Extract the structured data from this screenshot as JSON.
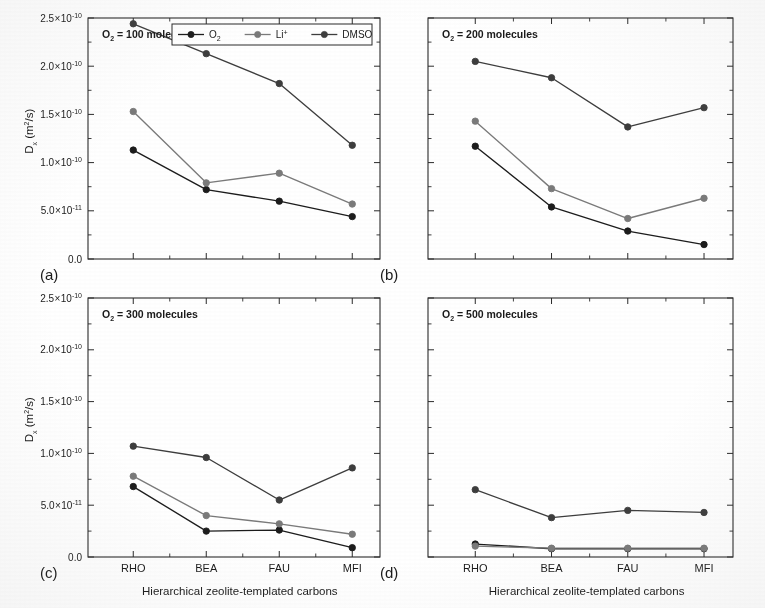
{
  "figure": {
    "caption_tags": [
      "(a)",
      "(b)",
      "(c)",
      "(d)"
    ],
    "x_axis_title": "Hierarchical zeolite-templated carbons",
    "y_axis_title_main": "D",
    "y_axis_title_sub": "x",
    "y_axis_title_unit": " (m",
    "y_axis_title_unit_sup": "2",
    "y_axis_title_unit_tail": "/s)"
  },
  "legend": {
    "position": "top-right of panel (a)",
    "entries": [
      {
        "label": "O",
        "sub": "2",
        "sup": "",
        "color": "#1c1c1c",
        "marker": "filled-circle"
      },
      {
        "label": "Li",
        "sub": "",
        "sup": "+",
        "color": "#7a7a7a",
        "marker": "filled-circle"
      },
      {
        "label": "DMSO",
        "sub": "",
        "sup": "",
        "color": "#3d3d3d",
        "marker": "filled-circle"
      }
    ]
  },
  "axis": {
    "y_ticks": [
      {
        "value": 0.0,
        "label_mantissa": "0.0",
        "label_base": "",
        "label_exp": ""
      },
      {
        "value": 5e-11,
        "label_mantissa": "5.0",
        "label_base": "10",
        "label_exp": "-11"
      },
      {
        "value": 1e-10,
        "label_mantissa": "1.0",
        "label_base": "10",
        "label_exp": "-10"
      },
      {
        "value": 1.5e-10,
        "label_mantissa": "1.5",
        "label_base": "10",
        "label_exp": "-10"
      },
      {
        "value": 2e-10,
        "label_mantissa": "2.0",
        "label_base": "10",
        "label_exp": "-10"
      },
      {
        "value": 2.5e-10,
        "label_mantissa": "2.5",
        "label_base": "10",
        "label_exp": "-10"
      }
    ],
    "y_min": 0.0,
    "y_max": 2.5e-10,
    "x_categories": [
      "RHO",
      "BEA",
      "FAU",
      "MFI"
    ],
    "grid": "none",
    "multiply_glyph": "×"
  },
  "chart_data": [
    {
      "panel": "a",
      "tag": "(a)",
      "type": "line",
      "title": "",
      "annotation_prefix": "O",
      "annotation_sub": "2",
      "annotation_suffix": " = 100 molecules",
      "annotation": "O2 = 100 molecules",
      "xlabel": "Hierarchical zeolite-templated carbons",
      "ylabel": "Dx (m2/s)",
      "ylim": [
        0,
        2.5e-10
      ],
      "categories": [
        "RHO",
        "BEA",
        "FAU",
        "MFI"
      ],
      "show_y_ticklabels": true,
      "show_x_ticklabels": false,
      "show_legend": true,
      "series": [
        {
          "name": "O2",
          "color": "#1c1c1c",
          "values": [
            1.13e-10,
            7.2e-11,
            6e-11,
            4.4e-11
          ]
        },
        {
          "name": "Li+",
          "color": "#7a7a7a",
          "values": [
            1.53e-10,
            7.9e-11,
            8.9e-11,
            5.7e-11
          ]
        },
        {
          "name": "DMSO",
          "color": "#3d3d3d",
          "values": [
            2.44e-10,
            2.13e-10,
            1.82e-10,
            1.18e-10
          ]
        }
      ]
    },
    {
      "panel": "b",
      "tag": "(b)",
      "type": "line",
      "title": "",
      "annotation_prefix": "O",
      "annotation_sub": "2",
      "annotation_suffix": " = 200 molecules",
      "annotation": "O2 = 200 molecules",
      "xlabel": "Hierarchical zeolite-templated carbons",
      "ylabel": "Dx (m2/s)",
      "ylim": [
        0,
        2.5e-10
      ],
      "categories": [
        "RHO",
        "BEA",
        "FAU",
        "MFI"
      ],
      "show_y_ticklabels": false,
      "show_x_ticklabels": false,
      "show_legend": false,
      "series": [
        {
          "name": "O2",
          "color": "#1c1c1c",
          "values": [
            1.17e-10,
            5.4e-11,
            2.9e-11,
            1.5e-11
          ]
        },
        {
          "name": "Li+",
          "color": "#7a7a7a",
          "values": [
            1.43e-10,
            7.3e-11,
            4.2e-11,
            6.3e-11
          ]
        },
        {
          "name": "DMSO",
          "color": "#3d3d3d",
          "values": [
            2.05e-10,
            1.88e-10,
            1.37e-10,
            1.57e-10
          ]
        }
      ]
    },
    {
      "panel": "c",
      "tag": "(c)",
      "type": "line",
      "title": "",
      "annotation_prefix": "O",
      "annotation_sub": "2",
      "annotation_suffix": " = 300 molecules",
      "annotation": "O2 = 300 molecules",
      "xlabel": "Hierarchical zeolite-templated carbons",
      "ylabel": "Dx (m2/s)",
      "ylim": [
        0,
        2.5e-10
      ],
      "categories": [
        "RHO",
        "BEA",
        "FAU",
        "MFI"
      ],
      "show_y_ticklabels": true,
      "show_x_ticklabels": true,
      "show_legend": false,
      "series": [
        {
          "name": "O2",
          "color": "#1c1c1c",
          "values": [
            6.8e-11,
            2.5e-11,
            2.6e-11,
            9e-12
          ]
        },
        {
          "name": "Li+",
          "color": "#7a7a7a",
          "values": [
            7.8e-11,
            4e-11,
            3.2e-11,
            2.2e-11
          ]
        },
        {
          "name": "DMSO",
          "color": "#3d3d3d",
          "values": [
            1.07e-10,
            9.6e-11,
            5.5e-11,
            8.6e-11
          ]
        }
      ]
    },
    {
      "panel": "d",
      "tag": "(d)",
      "type": "line",
      "title": "",
      "annotation_prefix": "O",
      "annotation_sub": "2",
      "annotation_suffix": " = 500 molecules",
      "annotation": "O2 = 500 molecules",
      "xlabel": "Hierarchical zeolite-templated carbons",
      "ylabel": "Dx (m2/s)",
      "ylim": [
        0,
        2.5e-10
      ],
      "categories": [
        "RHO",
        "BEA",
        "FAU",
        "MFI"
      ],
      "show_y_ticklabels": false,
      "show_x_ticklabels": true,
      "show_legend": false,
      "series": [
        {
          "name": "O2",
          "color": "#1c1c1c",
          "values": [
            1.25e-11,
            8e-12,
            8e-12,
            8e-12
          ]
        },
        {
          "name": "Li+",
          "color": "#7a7a7a",
          "values": [
            1.05e-11,
            8.5e-12,
            8.5e-12,
            8.5e-12
          ]
        },
        {
          "name": "DMSO",
          "color": "#3d3d3d",
          "values": [
            6.5e-11,
            3.8e-11,
            4.5e-11,
            4.3e-11
          ]
        }
      ]
    }
  ]
}
